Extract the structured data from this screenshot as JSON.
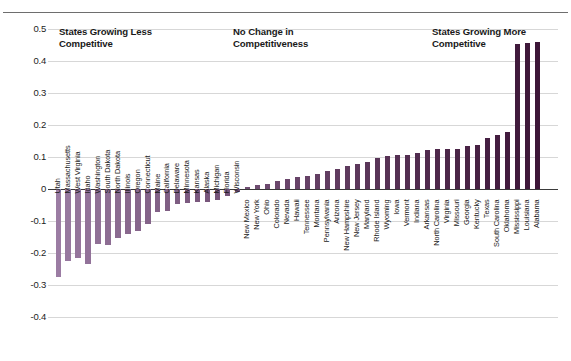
{
  "chart_data": {
    "type": "bar",
    "title": "",
    "xlabel": "",
    "ylabel": "",
    "ylim": [
      -0.4,
      0.5
    ],
    "ytick_labels": [
      "0.5",
      "0.4",
      "0.3",
      "0.2",
      "0.1",
      "0",
      "-0.1",
      "-0.2",
      "-0.3",
      "-0.4"
    ],
    "ytick_values": [
      0.5,
      0.4,
      0.3,
      0.2,
      0.1,
      0,
      -0.1,
      -0.2,
      -0.3,
      -0.4
    ],
    "grid": true,
    "legend_position": "none",
    "annotations": [
      {
        "text": "States Growing Less\nCompetitive",
        "x_state": "Massachusetts"
      },
      {
        "text": "No Change in\nCompetitiveness",
        "x_state": "Tennessee"
      },
      {
        "text": "States Growing More\nCompetitive",
        "x_state": "Missouri"
      }
    ],
    "colors": {
      "bar_negative": "#9b7ca3",
      "bar_positive": "#3d1638",
      "gridline": "#d7d7d7",
      "zero_line": "#3b3b3b",
      "text": "#1a1a1a",
      "top_rule": "#6e6e6e"
    },
    "categories": [
      "Utah",
      "Massachusetts",
      "West Virginia",
      "Idaho",
      "Washington",
      "South Dakota",
      "North Dakota",
      "Illinois",
      "Oregon",
      "Connecticut",
      "Maine",
      "California",
      "Delaware",
      "Minnesota",
      "Kansas",
      "Alaska",
      "Michigan",
      "Florida",
      "Wisconsin",
      "New Mexico",
      "New York",
      "Ohio",
      "Colorado",
      "Nevada",
      "Hawaii",
      "Tennessee",
      "Montana",
      "Pennsylvania",
      "Arizona",
      "New Hampshire",
      "New Jersey",
      "Maryland",
      "Rhode Island",
      "Wyoming",
      "Iowa",
      "Vermont",
      "Indiana",
      "Arkansas",
      "North Carolina",
      "Virginia",
      "Missouri",
      "Georgia",
      "Kentucky",
      "Texas",
      "South Carolina",
      "Oklahoma",
      "Mississippi",
      "Louisiana",
      "Alabama"
    ],
    "values": [
      -0.275,
      -0.225,
      -0.215,
      -0.235,
      -0.172,
      -0.175,
      -0.152,
      -0.142,
      -0.132,
      -0.108,
      -0.072,
      -0.068,
      -0.048,
      -0.045,
      -0.041,
      -0.04,
      -0.034,
      -0.022,
      -0.01,
      0.005,
      0.012,
      0.016,
      0.024,
      0.03,
      0.036,
      0.042,
      0.048,
      0.055,
      0.062,
      0.073,
      0.078,
      0.084,
      0.098,
      0.102,
      0.105,
      0.106,
      0.113,
      0.123,
      0.124,
      0.124,
      0.125,
      0.134,
      0.138,
      0.16,
      0.168,
      0.178,
      0.452,
      0.455,
      0.458
    ]
  }
}
